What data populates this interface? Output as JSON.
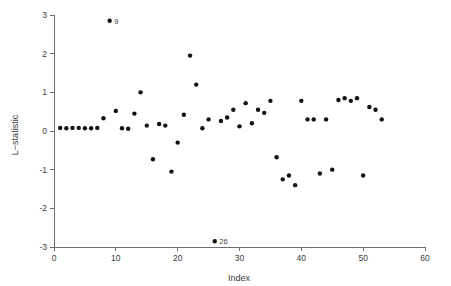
{
  "chart_data": {
    "type": "scatter",
    "title": "",
    "xlabel": "Index",
    "ylabel": "L−statistic",
    "xlim": [
      0,
      60
    ],
    "ylim": [
      -3,
      3
    ],
    "xticks": [
      0,
      10,
      20,
      30,
      40,
      50,
      60
    ],
    "xticklabels": [
      "0",
      "10",
      "20",
      "30",
      "40",
      "50",
      "60"
    ],
    "yticks": [
      -3,
      -2,
      -1,
      0,
      1,
      2,
      3
    ],
    "yticklabels": [
      "-3",
      "-2",
      "-1",
      "0",
      "1",
      "2",
      "3"
    ],
    "grid": false,
    "legend": null,
    "marker": "filled-circle",
    "marker_color": "#111111",
    "x": [
      1,
      2,
      3,
      4,
      5,
      6,
      7,
      8,
      9,
      10,
      11,
      12,
      13,
      14,
      15,
      16,
      17,
      18,
      19,
      20,
      21,
      22,
      23,
      24,
      25,
      26,
      27,
      28,
      29,
      30,
      31,
      32,
      33,
      34,
      35,
      36,
      37,
      38,
      39,
      40,
      41,
      42,
      43,
      44,
      45,
      46,
      47,
      48,
      49,
      50,
      51,
      52,
      53
    ],
    "y": [
      0.08,
      0.07,
      0.08,
      0.08,
      0.07,
      0.07,
      0.08,
      0.33,
      2.85,
      0.52,
      0.07,
      0.06,
      0.45,
      1.0,
      0.14,
      -0.73,
      0.18,
      0.14,
      -1.05,
      -0.3,
      0.42,
      1.95,
      1.2,
      0.07,
      0.3,
      -2.85,
      0.26,
      0.35,
      0.55,
      0.12,
      0.72,
      0.2,
      0.55,
      0.47,
      0.78,
      -0.68,
      -1.25,
      -1.15,
      -1.4,
      0.78,
      0.3,
      0.3,
      -1.1,
      0.3,
      -1.0,
      0.8,
      0.85,
      0.78,
      0.85,
      -1.15,
      0.62,
      0.55,
      0.3
    ],
    "annotations": [
      {
        "label": "9",
        "x": 9,
        "y": 2.85
      },
      {
        "label": "26",
        "x": 26,
        "y": -2.85
      }
    ]
  },
  "axes": {
    "x_title": "Index",
    "y_title": "L−statistic"
  },
  "colors": {
    "marker": "#111111",
    "axis": "#6e6e6e",
    "text": "#3a3a3a",
    "background": "#ffffff"
  }
}
